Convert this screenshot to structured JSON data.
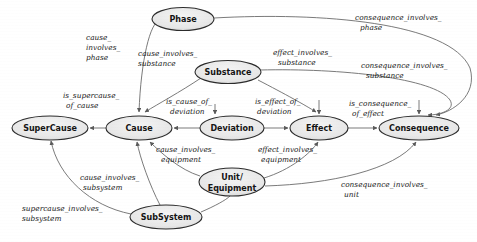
{
  "diagram": {
    "type": "directed-graph",
    "width": 477,
    "height": 242,
    "background_color": "#ffffff",
    "node_fill_color": "#e8e8e8",
    "node_stroke_color": "#2b2b2b",
    "edge_color": "#6b6b6b",
    "label_color": "#1a1a1a",
    "nodes": [
      {
        "id": "phase",
        "label": "Phase",
        "cx": 183,
        "cy": 19,
        "rx": 31,
        "ry": 11.5
      },
      {
        "id": "substance",
        "label": "Substance",
        "cx": 228,
        "cy": 72,
        "rx": 33,
        "ry": 11.5
      },
      {
        "id": "supercause",
        "label": "SuperCause",
        "cx": 50,
        "cy": 128,
        "rx": 38,
        "ry": 12
      },
      {
        "id": "cause",
        "label": "Cause",
        "cx": 139,
        "cy": 128,
        "rx": 33,
        "ry": 12
      },
      {
        "id": "deviation",
        "label": "Deviation",
        "cx": 232,
        "cy": 128,
        "rx": 32,
        "ry": 12
      },
      {
        "id": "effect",
        "label": "Effect",
        "cx": 319,
        "cy": 128,
        "rx": 29,
        "ry": 12
      },
      {
        "id": "consequence",
        "label": "Consequence",
        "cx": 419,
        "cy": 128,
        "rx": 40,
        "ry": 12
      },
      {
        "id": "unit",
        "label_line1": "Unit/",
        "label_line2": "Equipment",
        "label": "Unit/Equipment",
        "cx": 232,
        "cy": 182,
        "rx": 33,
        "ry": 14
      },
      {
        "id": "subsystem",
        "label": "SubSystem",
        "cx": 166,
        "cy": 217,
        "rx": 36,
        "ry": 12
      }
    ],
    "edges": [
      {
        "id": "cause_involves_phase",
        "label": "cause_\ninvolves_\nphase",
        "from": "cause",
        "to": "phase"
      },
      {
        "id": "cause_involves_substance",
        "label": "cause_involves_\nsubstance",
        "from": "cause",
        "to": "substance"
      },
      {
        "id": "effect_involves_substance",
        "label": "effect_involves_\nsubstance",
        "from": "effect",
        "to": "substance"
      },
      {
        "id": "consequence_involves_phase",
        "label": "consequence_involves_\nphase",
        "from": "consequence",
        "to": "phase"
      },
      {
        "id": "consequence_involves_substance",
        "label": "consequence_involves_\nsubstance",
        "from": "consequence",
        "to": "substance"
      },
      {
        "id": "is_supercause_of_cause",
        "label": "is_supercause_\nof_cause",
        "from": "supercause",
        "to": "cause"
      },
      {
        "id": "is_cause_of_deviation",
        "label": "is_cause_of_\ndeviation",
        "from": "cause",
        "to": "deviation"
      },
      {
        "id": "is_effect_of_deviation",
        "label": "is_effect_of_\ndeviation",
        "from": "deviation",
        "to": "effect"
      },
      {
        "id": "is_consequence_of_effect",
        "label": "is_consequence_\nof_effect",
        "from": "effect",
        "to": "consequence"
      },
      {
        "id": "cause_involves_equipment",
        "label": "cause_involves_\nequipment",
        "from": "unit",
        "to": "cause"
      },
      {
        "id": "effect_involves_equipment",
        "label": "effect_involves_\nequipment",
        "from": "unit",
        "to": "effect"
      },
      {
        "id": "cause_involves_subsystem",
        "label": "cause_involves_\nsubsystem",
        "from": "subsystem",
        "to": "cause"
      },
      {
        "id": "supercause_involves_subsystem",
        "label": "supercause_involves_\nsubsystem",
        "from": "subsystem",
        "to": "supercause"
      },
      {
        "id": "consequence_involves_unit",
        "label": "consequence_involves_\nunit",
        "from": "unit",
        "to": "consequence"
      }
    ],
    "edge_label_text": {
      "cause_involves_phase_l1": "cause_",
      "cause_involves_phase_l2": "involves_",
      "cause_involves_phase_l3": "phase",
      "cause_involves_substance_l1": "cause_involves_",
      "cause_involves_substance_l2": "substance",
      "effect_involves_substance_l1": "effect_involves_",
      "effect_involves_substance_l2": "substance",
      "consequence_involves_phase_l1": "consequence_involves_",
      "consequence_involves_phase_l2": "phase",
      "consequence_involves_substance_l1": "consequence_involves_",
      "consequence_involves_substance_l2": "substance",
      "is_supercause_of_cause_l1": "is_supercause_",
      "is_supercause_of_cause_l2": "of_cause",
      "is_cause_of_deviation_l1": "is_cause_of_",
      "is_cause_of_deviation_l2": "deviation",
      "is_effect_of_deviation_l1": "is_effect_of_",
      "is_effect_of_deviation_l2": "deviation",
      "is_consequence_of_effect_l1": "is_consequence_",
      "is_consequence_of_effect_l2": "of_effect",
      "cause_involves_equipment_l1": "cause_involves_",
      "cause_involves_equipment_l2": "equipment",
      "effect_involves_equipment_l1": "effect_involves_",
      "effect_involves_equipment_l2": "equipment",
      "cause_involves_subsystem_l1": "cause_involves_",
      "cause_involves_subsystem_l2": "subsystem",
      "supercause_involves_subsystem_l1": "supercause_involves_",
      "supercause_involves_subsystem_l2": "subsystem",
      "consequence_involves_unit_l1": "consequence_involves_",
      "consequence_involves_unit_l2": "unit"
    }
  }
}
